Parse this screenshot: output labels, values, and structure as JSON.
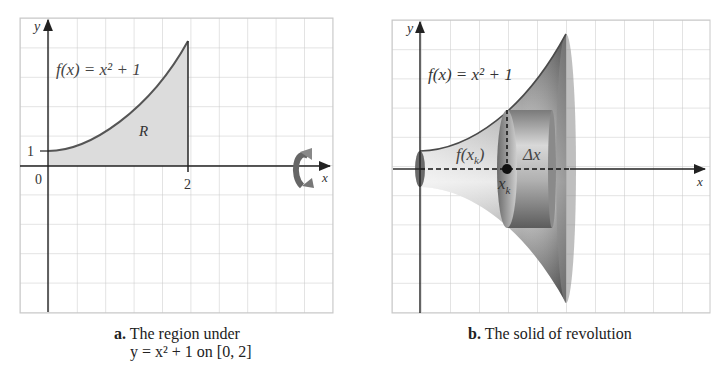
{
  "panel_a": {
    "function_label": "f(x) = x² + 1",
    "region_label": "R",
    "y_axis_label": "y",
    "x_axis_label": "x",
    "tick_y1": "1",
    "tick_origin": "0",
    "tick_x2": "2",
    "caption_letter": "a.",
    "caption_line1": "The region under",
    "caption_line2": "y = x² + 1 on [0, 2]"
  },
  "panel_b": {
    "function_label": "f(x) = x² + 1",
    "radius_label": "f(x",
    "radius_sub": "k",
    "thickness_label": "Δx",
    "point_label": "x",
    "point_sub": "k",
    "y_axis_label": "y",
    "x_axis_label": "x",
    "caption_letter": "b.",
    "caption_text": "The solid of revolution"
  },
  "colors": {
    "grid": "#c8c8c8",
    "axis": "#222222",
    "curve": "#555555",
    "region_fill": "#dcdcdc",
    "solid_dark": "#555555",
    "solid_light": "#e6e6e6"
  }
}
